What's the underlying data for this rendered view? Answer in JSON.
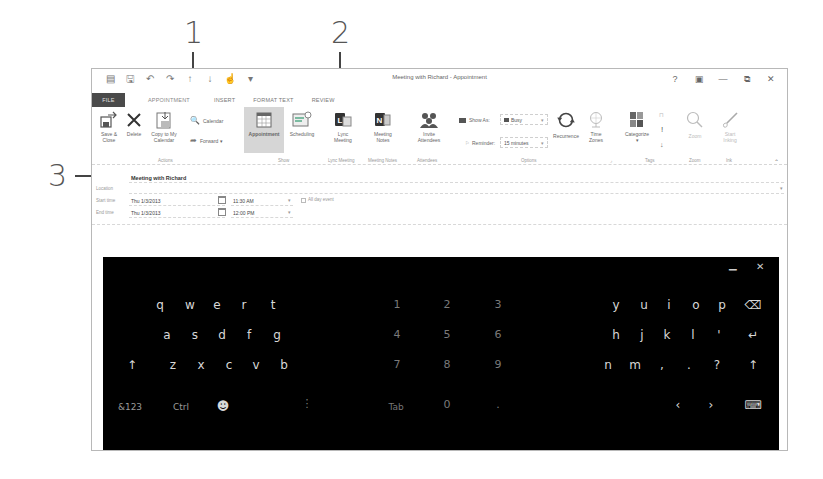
{
  "callouts": [
    {
      "label": "1",
      "target": "title-bar"
    },
    {
      "label": "2",
      "target": "subject-field"
    },
    {
      "label": "3",
      "target": "ribbon-tabs"
    }
  ],
  "window": {
    "title": "Meeting with Richard - Appointment",
    "controls": {
      "help": "?",
      "ribbon_options": "▣",
      "minimize": "—",
      "restore": "⧉",
      "close": "✕"
    },
    "quick_access": [
      "calendar-icon",
      "save-icon",
      "undo-icon",
      "redo-icon",
      "up-icon",
      "down-icon",
      "touch-mode-icon",
      "customize-icon"
    ]
  },
  "tabs": [
    {
      "label": "FILE"
    },
    {
      "label": "APPOINTMENT"
    },
    {
      "label": "INSERT"
    },
    {
      "label": "FORMAT TEXT"
    },
    {
      "label": "REVIEW"
    }
  ],
  "ribbon": {
    "actions": {
      "save_close": "Save &\nClose",
      "save_close_1": "Save &",
      "save_close_2": "Close",
      "delete": "Delete",
      "copy_1": "Copy to My",
      "copy_2": "Calendar",
      "calendar": "Calendar",
      "forward": "Forward ▾",
      "group": "Actions"
    },
    "show": {
      "appointment": "Appointment",
      "scheduling": "Scheduling",
      "group": "Show"
    },
    "lync": {
      "label_1": "Lync",
      "label_2": "Meeting",
      "group": "Lync Meeting"
    },
    "notes": {
      "label_1": "Meeting",
      "label_2": "Notes",
      "group": "Meeting Notes"
    },
    "attendees": {
      "label_1": "Invite",
      "label_2": "Attendees",
      "group": "Attendees"
    },
    "options": {
      "show_as_label": "Show As:",
      "show_as_value": "Busy",
      "reminder_label": "Reminder:",
      "reminder_value": "15 minutes",
      "recurrence": "Recurrence",
      "time_zones_1": "Time",
      "time_zones_2": "Zones",
      "group": "Options"
    },
    "tags": {
      "categorize": "Categorize",
      "categorize_arrow": "▾",
      "private": "🔒",
      "high": "!",
      "low": "↓",
      "group": "Tags"
    },
    "zoom": {
      "label": "Zoom",
      "group": "Zoom"
    },
    "ink": {
      "label_1": "Start",
      "label_2": "Inking",
      "group": "Ink"
    },
    "collapse": "⌃"
  },
  "form": {
    "subject": "Meeting with Richard",
    "location_label": "Location",
    "location_value": "",
    "start_label": "Start time",
    "start_date": "Thu 1/3/2013",
    "start_time": "11:30 AM",
    "all_day_label": "All day event",
    "end_label": "End time",
    "end_date": "Thu 1/3/2013",
    "end_time": "12:00 PM"
  },
  "keyboard": {
    "controls": {
      "minimize": "▁",
      "close": "✕"
    },
    "left_rows": [
      [
        "q",
        "w",
        "e",
        "r",
        "t"
      ],
      [
        "a",
        "s",
        "d",
        "f",
        "g"
      ],
      [
        "↑",
        "z",
        "x",
        "c",
        "v",
        "b"
      ]
    ],
    "numpad": [
      [
        "1",
        "2",
        "3"
      ],
      [
        "4",
        "5",
        "6"
      ],
      [
        "7",
        "8",
        "9"
      ],
      [
        "Tab",
        "0",
        "."
      ]
    ],
    "right_rows": [
      [
        "y",
        "u",
        "i",
        "o",
        "p",
        "⌫"
      ],
      [
        "h",
        "j",
        "k",
        "l",
        "'",
        "↵"
      ],
      [
        "n",
        "m",
        ",",
        ".",
        "?",
        "↑"
      ]
    ],
    "bottom_left": [
      "&123",
      "Ctrl",
      "☻"
    ],
    "bottom_right": [
      "‹",
      "›",
      "⌨"
    ],
    "dots": "⋮"
  }
}
